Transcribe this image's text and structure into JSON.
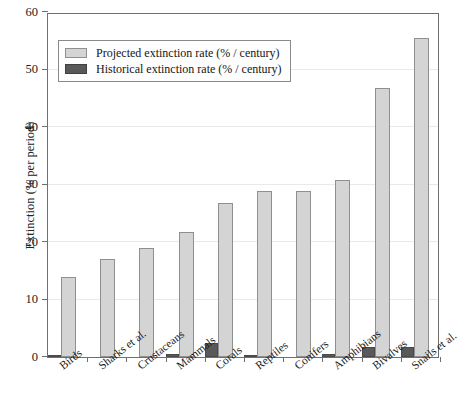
{
  "chart_data": {
    "type": "bar",
    "title": "",
    "xlabel": "",
    "ylabel": "Extinction (% per period)",
    "ylim": [
      0,
      60
    ],
    "yticks": [
      0,
      10,
      20,
      30,
      40,
      50,
      60
    ],
    "grid": true,
    "legend_position": "upper left",
    "categories": [
      "Birds",
      "Sharks et al.",
      "Crustaceans",
      "Mammals",
      "Corals",
      "Reptiles",
      "Conifers",
      "Amphibians",
      "Bivalves",
      "Snails et al."
    ],
    "series": [
      {
        "name": "Projected extinction rate (% / century)",
        "color": "#d4d4d4",
        "values": [
          14.0,
          17.0,
          18.9,
          21.8,
          26.8,
          28.8,
          28.8,
          30.7,
          46.8,
          55.5
        ]
      },
      {
        "name": "Historical extinction rate (% / century)",
        "color": "#595959",
        "values": [
          0.35,
          0.0,
          0.0,
          0.45,
          2.5,
          0.25,
          0.0,
          0.5,
          1.7,
          1.7
        ]
      }
    ]
  },
  "legend": {
    "items": [
      {
        "label": "Projected extinction rate (% / century)",
        "swatch": "projected"
      },
      {
        "label": "Historical extinction rate (% / century)",
        "swatch": "historical"
      }
    ]
  },
  "axes": {
    "y_title": "Extinction (% per period)"
  }
}
